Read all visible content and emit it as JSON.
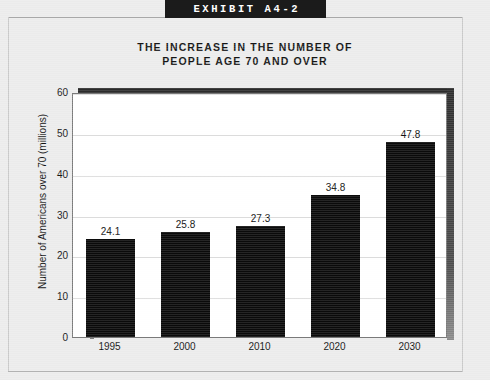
{
  "exhibit": {
    "tab_label": "EXHIBIT A4-2"
  },
  "chart_data": {
    "type": "bar",
    "title": "THE INCREASE IN THE NUMBER OF PEOPLE AGE 70 AND OVER",
    "title_line1": "THE INCREASE IN THE NUMBER OF",
    "title_line2": "PEOPLE AGE 70 AND OVER",
    "categories": [
      "1995",
      "2000",
      "2010",
      "2020",
      "2030"
    ],
    "values": [
      24.1,
      25.8,
      27.3,
      34.8,
      47.8
    ],
    "value_labels": [
      "24.1",
      "25.8",
      "27.3",
      "34.8",
      "47.8"
    ],
    "xlabel": "",
    "ylabel": "Number of Americans over 70 (millions)",
    "ylim": [
      0,
      60
    ],
    "yticks": [
      0,
      10,
      20,
      30,
      40,
      50,
      60
    ],
    "ytick_labels": [
      "0",
      "10",
      "20",
      "30",
      "40",
      "50",
      "60"
    ],
    "grid": true,
    "grid_axis": "y",
    "legend": false,
    "bar_color": "#0a0a0a",
    "plot_background": "#ffffff",
    "page_background": "#ececec",
    "gridline_color": "#dcdcdc"
  }
}
